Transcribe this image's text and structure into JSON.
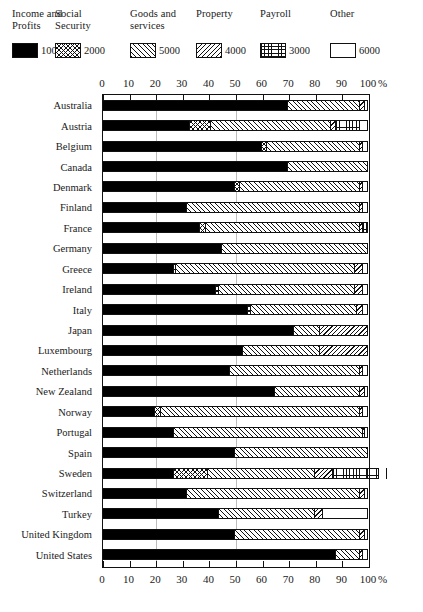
{
  "legend": {
    "entries": [
      {
        "name": "Income and\nProfits",
        "value": "1000",
        "pattern": "solid-black",
        "key": "income"
      },
      {
        "name": "Social\nSecurity",
        "value": "2000",
        "pattern": "crosshatch",
        "key": "social"
      },
      {
        "name": "Goods and\nservices",
        "value": "5000",
        "pattern": "diagonal-left",
        "key": "goods"
      },
      {
        "name": "Property",
        "value": "4000",
        "pattern": "diagonal-right",
        "key": "property"
      },
      {
        "name": "Payroll",
        "value": "3000",
        "pattern": "grid",
        "key": "payroll"
      },
      {
        "name": "Other",
        "value": "6000",
        "pattern": "blank-white",
        "key": "other"
      }
    ]
  },
  "axis": {
    "unit_symbol": "%",
    "ticks": [
      "0",
      "10",
      "20",
      "30",
      "40",
      "50",
      "60",
      "70",
      "80",
      "90",
      "100"
    ],
    "min": 0,
    "max": 100
  },
  "chart_data": {
    "type": "bar",
    "orientation": "horizontal",
    "stacked": true,
    "normalized_percent": true,
    "title": "",
    "xlabel": "%",
    "ylabel": "",
    "xlim": [
      0,
      100
    ],
    "grid": true,
    "legend_position": "top",
    "series": [
      {
        "name": "Income and Profits",
        "code": "1000",
        "values": [
          70,
          33,
          60,
          70,
          50,
          32,
          37,
          45,
          27,
          43,
          55,
          72,
          53,
          48,
          65,
          20,
          27,
          50,
          27,
          32,
          44,
          50,
          88
        ]
      },
      {
        "name": "Social Security",
        "code": "2000",
        "values": [
          0,
          8,
          2,
          0,
          2,
          0,
          2,
          0,
          1,
          1,
          1,
          0,
          0,
          0,
          0,
          2,
          0,
          0,
          13,
          0,
          0,
          0,
          0
        ]
      },
      {
        "name": "Goods and services",
        "code": "5000",
        "values": [
          27,
          45,
          35,
          30,
          45,
          65,
          58,
          55,
          67,
          51,
          40,
          10,
          29,
          49,
          32,
          75,
          71,
          50,
          40,
          65,
          36,
          47,
          9
        ]
      },
      {
        "name": "Property",
        "code": "4000",
        "values": [
          2,
          2,
          1,
          0,
          1,
          1,
          1,
          0,
          3,
          3,
          2,
          18,
          18,
          1,
          2,
          1,
          1,
          0,
          7,
          2,
          3,
          2,
          1
        ]
      },
      {
        "name": "Payroll",
        "code": "3000",
        "values": [
          0,
          9,
          0,
          0,
          0,
          0,
          2,
          0,
          0,
          0,
          0,
          0,
          0,
          0,
          0,
          0,
          0,
          0,
          17,
          0,
          0,
          0,
          0
        ]
      },
      {
        "name": "Other",
        "code": "6000",
        "values": [
          1,
          3,
          2,
          0,
          2,
          2,
          0,
          0,
          2,
          2,
          2,
          0,
          0,
          2,
          1,
          2,
          1,
          0,
          3,
          1,
          17,
          1,
          2
        ]
      }
    ],
    "categories": [
      "Australia",
      "Austria",
      "Belgium",
      "Canada",
      "Denmark",
      "Finland",
      "France",
      "Germany",
      "Greece",
      "Ireland",
      "Italy",
      "Japan",
      "Luxembourg",
      "Netherlands",
      "New Zealand",
      "Norway",
      "Portugal",
      "Spain",
      "Sweden",
      "Switzerland",
      "Turkey",
      "United Kingdom",
      "United States"
    ]
  }
}
